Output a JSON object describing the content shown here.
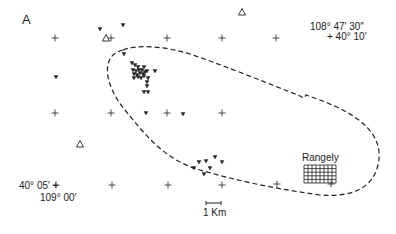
{
  "panel_label": "A",
  "corner_labels": {
    "top_right_lon": "108° 47′ 30″",
    "top_right_lat": "+ 40° 10′",
    "bottom_left_lat": "40° 05′ +",
    "bottom_left_lon": "109° 00′"
  },
  "town": {
    "name": "Rangely",
    "grid": {
      "x": 304,
      "y": 165,
      "w": 32,
      "h": 18
    }
  },
  "scale_bar": {
    "label": "1 Km",
    "x1": 206,
    "x2": 221,
    "y": 203
  },
  "grid_crosses": [
    {
      "x": 55,
      "y": 38
    },
    {
      "x": 111,
      "y": 38
    },
    {
      "x": 167,
      "y": 38
    },
    {
      "x": 222,
      "y": 38
    },
    {
      "x": 276,
      "y": 38
    },
    {
      "x": 55,
      "y": 113
    },
    {
      "x": 111,
      "y": 113
    },
    {
      "x": 167,
      "y": 113
    },
    {
      "x": 222,
      "y": 113
    },
    {
      "x": 56,
      "y": 185
    },
    {
      "x": 112,
      "y": 185
    },
    {
      "x": 168,
      "y": 185
    },
    {
      "x": 222,
      "y": 185
    },
    {
      "x": 277,
      "y": 184
    },
    {
      "x": 331,
      "y": 184
    }
  ],
  "stations": [
    {
      "x": 106,
      "y": 38
    },
    {
      "x": 242,
      "y": 12
    },
    {
      "x": 80,
      "y": 144
    }
  ],
  "earthquakes": [
    {
      "x": 100,
      "y": 29
    },
    {
      "x": 123,
      "y": 25
    },
    {
      "x": 124,
      "y": 54
    },
    {
      "x": 56,
      "y": 77
    },
    {
      "x": 132,
      "y": 63
    },
    {
      "x": 135,
      "y": 65
    },
    {
      "x": 138,
      "y": 67
    },
    {
      "x": 144,
      "y": 67
    },
    {
      "x": 133,
      "y": 70
    },
    {
      "x": 136,
      "y": 71
    },
    {
      "x": 139,
      "y": 70
    },
    {
      "x": 142,
      "y": 70
    },
    {
      "x": 145,
      "y": 72
    },
    {
      "x": 134,
      "y": 74
    },
    {
      "x": 137,
      "y": 75
    },
    {
      "x": 140,
      "y": 73
    },
    {
      "x": 143,
      "y": 74
    },
    {
      "x": 147,
      "y": 71
    },
    {
      "x": 134,
      "y": 78
    },
    {
      "x": 138,
      "y": 77
    },
    {
      "x": 141,
      "y": 78
    },
    {
      "x": 144,
      "y": 76
    },
    {
      "x": 155,
      "y": 71
    },
    {
      "x": 148,
      "y": 78
    },
    {
      "x": 147,
      "y": 82
    },
    {
      "x": 147,
      "y": 86
    },
    {
      "x": 144,
      "y": 92
    },
    {
      "x": 148,
      "y": 92
    },
    {
      "x": 146,
      "y": 113
    },
    {
      "x": 183,
      "y": 114
    },
    {
      "x": 199,
      "y": 162
    },
    {
      "x": 206,
      "y": 161
    },
    {
      "x": 215,
      "y": 157
    },
    {
      "x": 222,
      "y": 162
    },
    {
      "x": 194,
      "y": 168
    },
    {
      "x": 210,
      "y": 168
    },
    {
      "x": 204,
      "y": 174
    }
  ],
  "boundary_path": "M 123 50 C 100 55, 104 85, 125 110 C 145 135, 165 160, 200 170 C 235 180, 270 188, 320 195 C 350 197, 372 190, 378 165 C 385 135, 360 115, 320 100 L 306 95 L 304 98 L 300 96 C 270 84, 220 64, 190 54 C 160 45, 135 45, 123 50 Z",
  "colors": {
    "ink": "#222222",
    "background": "#ffffff"
  }
}
